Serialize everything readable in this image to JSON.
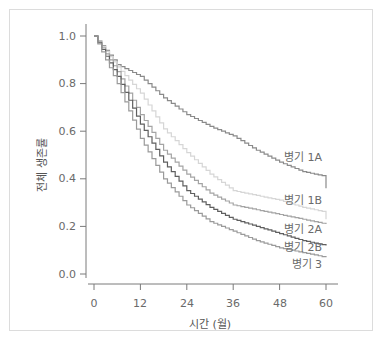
{
  "chart_data": {
    "type": "line",
    "subtype": "kaplan-meier step",
    "title": "",
    "xlabel": "시간 (월)",
    "ylabel": "전체 생존률",
    "xlim": [
      0,
      60
    ],
    "ylim": [
      0.0,
      1.0
    ],
    "x_ticks": [
      "0",
      "12",
      "24",
      "36",
      "48",
      "60"
    ],
    "y_ticks": [
      "0.0",
      "0.2",
      "0.4",
      "0.6",
      "0.8",
      "1.0"
    ],
    "grid": false,
    "legend_position": "inline labels at right end of curves",
    "x": [
      0,
      6,
      12,
      18,
      24,
      30,
      36,
      42,
      48,
      54,
      60
    ],
    "series": [
      {
        "name": "병기 1A",
        "color": "#8a8a8a",
        "values": [
          1.0,
          0.88,
          0.83,
          0.74,
          0.67,
          0.62,
          0.58,
          0.52,
          0.47,
          0.43,
          0.41
        ]
      },
      {
        "name": "병기 1B",
        "color": "#d6d6d6",
        "values": [
          1.0,
          0.87,
          0.76,
          0.61,
          0.51,
          0.42,
          0.35,
          0.33,
          0.31,
          0.28,
          0.26
        ]
      },
      {
        "name": "병기 2A",
        "color": "#a4a4a4",
        "values": [
          1.0,
          0.85,
          0.67,
          0.52,
          0.42,
          0.34,
          0.29,
          0.27,
          0.25,
          0.23,
          0.21
        ]
      },
      {
        "name": "병기 2B",
        "color": "#5f5f5f",
        "values": [
          1.0,
          0.83,
          0.63,
          0.47,
          0.35,
          0.28,
          0.23,
          0.2,
          0.17,
          0.14,
          0.12
        ]
      },
      {
        "name": "병기 3",
        "color": "#9a9a9a",
        "values": [
          1.0,
          0.8,
          0.57,
          0.4,
          0.29,
          0.22,
          0.18,
          0.14,
          0.11,
          0.09,
          0.07
        ]
      }
    ],
    "end_values": {
      "병기 1A": 0.36,
      "병기 1B": 0.23
    }
  },
  "labels": {
    "xlabel": "시간 (월)",
    "ylabel": "전체 생존률",
    "x_ticks": [
      "0",
      "12",
      "24",
      "36",
      "48",
      "60"
    ],
    "y_ticks": [
      "0.0",
      "0.2",
      "0.4",
      "0.6",
      "0.8",
      "1.0"
    ],
    "series": [
      "병기 1A",
      "병기 1B",
      "병기 2A",
      "병기 2B",
      "병기 3"
    ]
  }
}
